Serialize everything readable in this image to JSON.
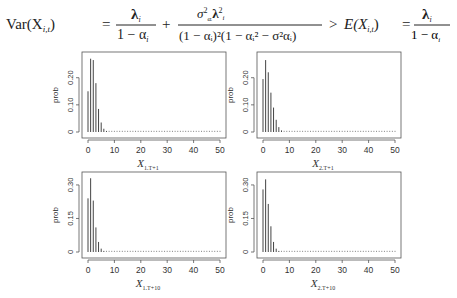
{
  "formula": {
    "lhs": "Var(X",
    "lhs_sub": "i,t",
    "lhs_close": ")",
    "eq1": "=",
    "frac1_num": "λ",
    "frac1_num_sub": "i",
    "frac1_den": "1 − α",
    "frac1_den_sub": "i",
    "plus": "+",
    "frac2_num": "σ²αᵢ λᵢ²",
    "frac2_den": "(1 − αᵢ)²(1 − αᵢ² − σ²αᵢ)",
    "gt": ">",
    "rhs_E": "E(X",
    "rhs_E_sub": "i,t",
    "rhs_E_close": ")",
    "eq2": "=",
    "frac3_num": "λ",
    "frac3_num_sub": "i",
    "frac3_den": "1 − α",
    "frac3_den_sub": "i",
    "tail": ",i = 1,2"
  },
  "chart_data": [
    {
      "type": "bar",
      "title": "",
      "xlabel": "X_{1,T+1}",
      "xlabel_main": "X",
      "xlabel_sub": "1,T+1",
      "ylabel": "prob",
      "xlim": [
        0,
        50
      ],
      "ylim": [
        0,
        0.28
      ],
      "xticks": [
        "0",
        "10",
        "20",
        "30",
        "40",
        "50"
      ],
      "yticks": [
        "0",
        "0.10",
        "0.20"
      ],
      "ytick_values": [
        0,
        0.1,
        0.2
      ],
      "grid": false,
      "x": [
        0,
        1,
        2,
        3,
        4,
        5,
        6,
        7,
        8,
        9,
        10,
        11,
        12,
        13,
        14,
        15,
        16,
        17,
        18,
        19,
        20,
        21,
        22,
        23,
        24,
        25,
        26,
        27,
        28,
        29,
        30,
        31,
        32,
        33,
        34,
        35,
        36,
        37,
        38,
        39,
        40,
        41,
        42,
        43,
        44,
        45,
        46,
        47,
        48,
        49,
        50
      ],
      "values": [
        0.15,
        0.27,
        0.265,
        0.18,
        0.085,
        0.035,
        0.012,
        0.004,
        0.002,
        0.001,
        0.001,
        0.001,
        0.001,
        0.001,
        0.001,
        0.001,
        0.001,
        0.001,
        0.001,
        0.001,
        0.001,
        0.001,
        0.001,
        0.001,
        0.001,
        0.001,
        0.001,
        0.001,
        0.001,
        0.001,
        0.001,
        0.001,
        0.001,
        0.001,
        0.001,
        0.001,
        0.001,
        0.001,
        0.001,
        0.001,
        0.001,
        0.001,
        0.001,
        0.001,
        0.001,
        0.001,
        0.001,
        0.001,
        0.001,
        0.001,
        0.001
      ]
    },
    {
      "type": "bar",
      "title": "",
      "xlabel": "X_{2,T+1}",
      "xlabel_main": "X",
      "xlabel_sub": "2,T+1",
      "ylabel": "prob",
      "xlim": [
        0,
        50
      ],
      "ylim": [
        0,
        0.28
      ],
      "xticks": [
        "0",
        "10",
        "20",
        "30",
        "40",
        "50"
      ],
      "yticks": [
        "0",
        "0.10",
        "0.20"
      ],
      "ytick_values": [
        0,
        0.1,
        0.2
      ],
      "grid": false,
      "x": [
        0,
        1,
        2,
        3,
        4,
        5,
        6,
        7,
        8,
        9,
        10,
        11,
        12,
        13,
        14,
        15,
        16,
        17,
        18,
        19,
        20,
        21,
        22,
        23,
        24,
        25,
        26,
        27,
        28,
        29,
        30,
        31,
        32,
        33,
        34,
        35,
        36,
        37,
        38,
        39,
        40,
        41,
        42,
        43,
        44,
        45,
        46,
        47,
        48,
        49,
        50
      ],
      "values": [
        0.195,
        0.265,
        0.22,
        0.145,
        0.09,
        0.045,
        0.018,
        0.006,
        0.002,
        0.001,
        0.001,
        0.001,
        0.001,
        0.001,
        0.001,
        0.001,
        0.001,
        0.001,
        0.001,
        0.001,
        0.001,
        0.001,
        0.001,
        0.001,
        0.001,
        0.001,
        0.001,
        0.001,
        0.001,
        0.001,
        0.001,
        0.001,
        0.001,
        0.001,
        0.001,
        0.001,
        0.001,
        0.001,
        0.001,
        0.001,
        0.001,
        0.001,
        0.001,
        0.001,
        0.001,
        0.001,
        0.001,
        0.001,
        0.001,
        0.001,
        0.001
      ]
    },
    {
      "type": "bar",
      "title": "",
      "xlabel": "X_{1,T+10}",
      "xlabel_main": "X",
      "xlabel_sub": "1,T+10",
      "ylabel": "prob",
      "xlim": [
        0,
        50
      ],
      "ylim": [
        0,
        0.34
      ],
      "xticks": [
        "0",
        "10",
        "20",
        "30",
        "40",
        "50"
      ],
      "yticks": [
        "0",
        "0.15",
        "0.30"
      ],
      "ytick_values": [
        0,
        0.15,
        0.3
      ],
      "grid": false,
      "x": [
        0,
        1,
        2,
        3,
        4,
        5,
        6,
        7,
        8,
        9,
        10,
        11,
        12,
        13,
        14,
        15,
        16,
        17,
        18,
        19,
        20,
        21,
        22,
        23,
        24,
        25,
        26,
        27,
        28,
        29,
        30,
        31,
        32,
        33,
        34,
        35,
        36,
        37,
        38,
        39,
        40,
        41,
        42,
        43,
        44,
        45,
        46,
        47,
        48,
        49,
        50
      ],
      "values": [
        0.24,
        0.33,
        0.23,
        0.11,
        0.045,
        0.015,
        0.005,
        0.002,
        0.001,
        0.001,
        0.001,
        0.001,
        0.001,
        0.001,
        0.001,
        0.001,
        0.001,
        0.001,
        0.001,
        0.001,
        0.001,
        0.001,
        0.001,
        0.001,
        0.001,
        0.001,
        0.001,
        0.001,
        0.001,
        0.001,
        0.001,
        0.001,
        0.001,
        0.001,
        0.001,
        0.001,
        0.001,
        0.001,
        0.001,
        0.001,
        0.001,
        0.001,
        0.001,
        0.001,
        0.001,
        0.001,
        0.001,
        0.001,
        0.001,
        0.001,
        0.001
      ]
    },
    {
      "type": "bar",
      "title": "",
      "xlabel": "X_{2,T+10}",
      "xlabel_main": "X",
      "xlabel_sub": "2,T+10",
      "ylabel": "prob",
      "xlim": [
        0,
        50
      ],
      "ylim": [
        0,
        0.34
      ],
      "xticks": [
        "0",
        "10",
        "20",
        "30",
        "40",
        "50"
      ],
      "yticks": [
        "0",
        "0.15",
        "0.30"
      ],
      "ytick_values": [
        0,
        0.15,
        0.3
      ],
      "grid": false,
      "x": [
        0,
        1,
        2,
        3,
        4,
        5,
        6,
        7,
        8,
        9,
        10,
        11,
        12,
        13,
        14,
        15,
        16,
        17,
        18,
        19,
        20,
        21,
        22,
        23,
        24,
        25,
        26,
        27,
        28,
        29,
        30,
        31,
        32,
        33,
        34,
        35,
        36,
        37,
        38,
        39,
        40,
        41,
        42,
        43,
        44,
        45,
        46,
        47,
        48,
        49,
        50
      ],
      "values": [
        0.28,
        0.325,
        0.215,
        0.115,
        0.045,
        0.015,
        0.005,
        0.002,
        0.001,
        0.001,
        0.001,
        0.001,
        0.001,
        0.001,
        0.001,
        0.001,
        0.001,
        0.001,
        0.001,
        0.001,
        0.001,
        0.001,
        0.001,
        0.001,
        0.001,
        0.001,
        0.001,
        0.001,
        0.001,
        0.001,
        0.001,
        0.001,
        0.001,
        0.001,
        0.001,
        0.001,
        0.001,
        0.001,
        0.001,
        0.001,
        0.001,
        0.001,
        0.001,
        0.001,
        0.001,
        0.001,
        0.001,
        0.001,
        0.001,
        0.001,
        0.001
      ]
    }
  ]
}
